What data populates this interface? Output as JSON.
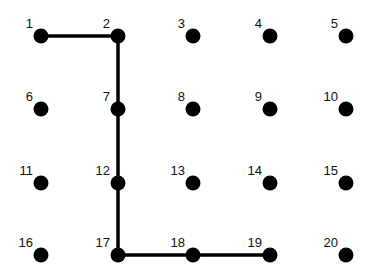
{
  "diagram": {
    "type": "dot-grid-path",
    "columns_x": [
      41,
      118,
      193,
      270,
      346
    ],
    "rows_y": [
      36,
      109,
      183,
      255
    ],
    "dots": [
      {
        "label": "1"
      },
      {
        "label": "2"
      },
      {
        "label": "3"
      },
      {
        "label": "4"
      },
      {
        "label": "5"
      },
      {
        "label": "6"
      },
      {
        "label": "7"
      },
      {
        "label": "8"
      },
      {
        "label": "9"
      },
      {
        "label": "10"
      },
      {
        "label": "11"
      },
      {
        "label": "12"
      },
      {
        "label": "13"
      },
      {
        "label": "14"
      },
      {
        "label": "15"
      },
      {
        "label": "16"
      },
      {
        "label": "17"
      },
      {
        "label": "18"
      },
      {
        "label": "19"
      },
      {
        "label": "20"
      }
    ],
    "path": [
      1,
      2,
      7,
      12,
      17,
      18,
      19
    ],
    "dot_color": "#000000",
    "line_color": "#000000"
  }
}
